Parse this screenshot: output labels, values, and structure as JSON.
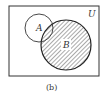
{
  "diagram": {
    "type": "venn",
    "universe_label": "U",
    "sets": [
      {
        "label": "A",
        "shaded": false
      },
      {
        "label": "B",
        "shaded": true
      }
    ],
    "shaded_region": "B",
    "caption": "(b)",
    "colors": {
      "stroke": "#333333",
      "hatch": "#555555",
      "background": "#ffffff"
    }
  }
}
